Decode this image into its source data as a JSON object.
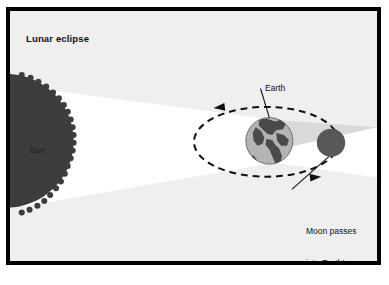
{
  "figure": {
    "title": "Lunar eclipse",
    "background_color": "#efefef",
    "border_color": "#000000",
    "page_color": "#ffffff"
  },
  "labels": {
    "title": "Lunar eclipse",
    "sun": "Sun",
    "earth": "Earth",
    "moon_caption_line1": "Moon passes",
    "moon_caption_line2": "into Earth's",
    "moon_caption_line3": "shadow"
  },
  "bodies": {
    "sun": {
      "name": "Sun",
      "color": "#3d3d3d",
      "center_x": -10,
      "center_y": 140,
      "radius": 66,
      "edge": "jagged"
    },
    "earth": {
      "name": "Earth",
      "ocean_color": "#b4b4b4",
      "land_color": "#4b4b4b",
      "outline_color": "#5a5a5a",
      "center_x": 271,
      "center_y": 141,
      "radius": 24
    },
    "moon": {
      "name": "Moon",
      "color": "#585858",
      "center_x": 334,
      "center_y": 143,
      "radius": 14
    }
  },
  "light_cone": {
    "name": "sunlight-beam",
    "color": "#ffffff"
  },
  "shadow_cone": {
    "name": "earth-umbra",
    "color": "#d9d9d9"
  },
  "orbit": {
    "name": "moon-orbit",
    "style": "dashed",
    "color": "#111111",
    "center_x": 268,
    "center_y": 143,
    "radius_x": 74,
    "radius_y": 36,
    "arrow_top_direction": "left",
    "arrow_bottom_direction": "right"
  },
  "leader_lines": {
    "earth": {
      "x1": 262,
      "y1": 86,
      "x2": 271,
      "y2": 117
    },
    "moon": {
      "x1": 294,
      "y1": 190,
      "x2": 332,
      "y2": 157
    }
  }
}
